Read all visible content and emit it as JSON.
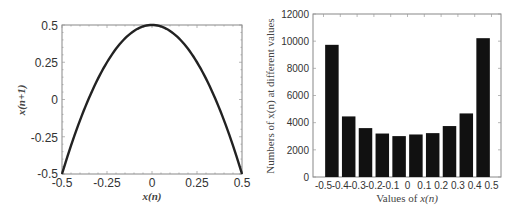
{
  "chart_data": [
    {
      "type": "line",
      "title": "",
      "xlabel": "x(n)",
      "ylabel": "x(n+1)",
      "xlim": [
        -0.5,
        0.5
      ],
      "ylim": [
        -0.5,
        0.5
      ],
      "xticks": [
        "-0.5",
        "-0.25",
        "0",
        "0.25",
        "0.5"
      ],
      "yticks": [
        "0.5",
        "0.25",
        "0",
        "-0.25",
        "-0.5"
      ],
      "grid": false,
      "series": [
        {
          "name": "map",
          "equation": "x(n+1) = 0.5 - 4*x(n)^2",
          "x": [
            -0.5,
            -0.4,
            -0.3,
            -0.2,
            -0.1,
            0,
            0.1,
            0.2,
            0.3,
            0.4,
            0.5
          ],
          "y": [
            -0.5,
            -0.14,
            0.14,
            0.34,
            0.46,
            0.5,
            0.46,
            0.34,
            0.14,
            -0.14,
            -0.5
          ]
        }
      ]
    },
    {
      "type": "bar",
      "title": "",
      "xlabel": "Values of x(n)",
      "ylabel": "Numbers of x(n) at different values",
      "categories": [
        "-0.5~-0.4",
        "-0.4~-0.3",
        "-0.3~-0.2",
        "-0.2~-0.1",
        "-0.1~0",
        "0~0.1",
        "0.1~0.2",
        "0.2~0.3",
        "0.3~0.4",
        "0.4~0.5"
      ],
      "xticks": [
        "-0.5",
        "-0.4",
        "-0.3",
        "-0.2",
        "-0.1",
        "0",
        "0.1",
        "0.2",
        "0.3",
        "0.4",
        "0.5"
      ],
      "values": [
        9730,
        4460,
        3600,
        3200,
        3010,
        3130,
        3230,
        3750,
        4680,
        10220
      ],
      "yticks": [
        "0",
        "2000",
        "4000",
        "6000",
        "8000",
        "10000",
        "12000"
      ],
      "ylim": [
        0,
        12000
      ],
      "grid": false,
      "bar_color": "#111111"
    }
  ],
  "left": {
    "xlabel": "x(n)",
    "ylabel": "x(n+1)",
    "xticks": [
      "-0.5",
      "-0.25",
      "0",
      "0.25",
      "0.5"
    ],
    "yticks": [
      "0.5",
      "0.25",
      "0",
      "-0.25",
      "-0.5"
    ]
  },
  "right": {
    "xlabel": "Values of x(n)",
    "ylabel": "Numbers of x(n) at different values",
    "xticks": [
      "-0.5",
      "-0.4",
      "-0.3",
      "-0.2",
      "-0.1",
      "0",
      "0.1",
      "0.2",
      "0.3",
      "0.4",
      "0.5"
    ],
    "yticks": [
      "0",
      "2000",
      "4000",
      "6000",
      "8000",
      "10000",
      "12000"
    ]
  }
}
